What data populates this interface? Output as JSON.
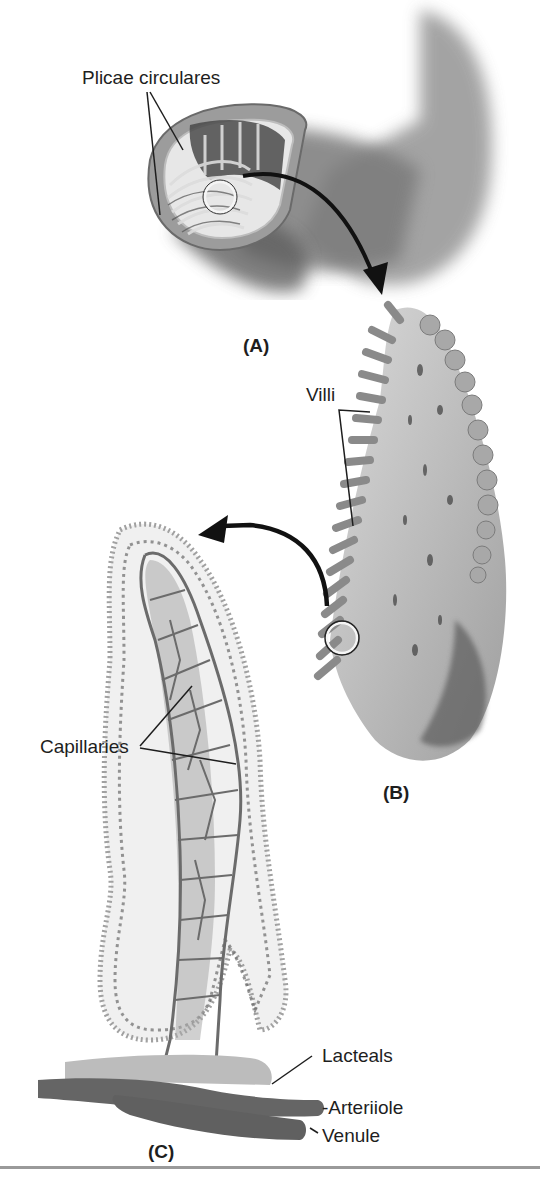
{
  "figure": {
    "panels": [
      {
        "id": "A",
        "label": "(A)",
        "description": "Segment of small intestine cut open showing plicae circulares"
      },
      {
        "id": "B",
        "label": "(B)",
        "description": "Magnified plica showing villi"
      },
      {
        "id": "C",
        "label": "(C)",
        "description": "Single villus showing capillaries, lacteals, arteriole and venule"
      }
    ],
    "labels": {
      "plicae": "Plicae circulares",
      "villi": "Villi",
      "capillaries": "Capillaries",
      "lacteals": "Lacteals",
      "arteriole": "-Arteriiole",
      "venule": "Venule"
    },
    "colors": {
      "ink": "#1e1e1e",
      "tissue_dark": "#5a5a5a",
      "tissue_mid": "#8c8c8c",
      "tissue_light": "#c8c8c8",
      "vessel": "#6b6b6b",
      "lacteal": "#b4b4b4",
      "divider": "#9a9a9a"
    }
  }
}
